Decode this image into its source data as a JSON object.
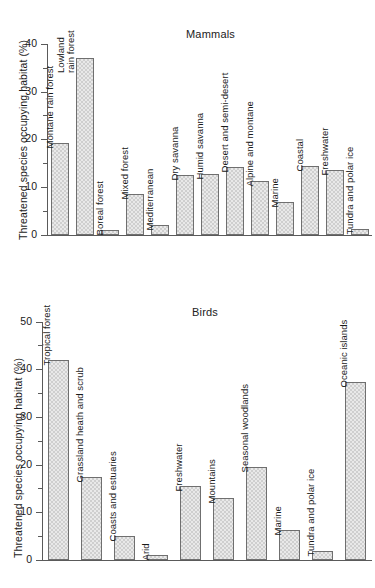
{
  "figure": {
    "ylabel": "Threatened species occupying habitat (%)",
    "footer_note": ""
  },
  "chart_data": [
    {
      "type": "bar",
      "title": "Mammals",
      "xlabel": "",
      "ylabel": "Threatened species occupying habitat (%)",
      "ylim": [
        0,
        41
      ],
      "yticks": [
        0,
        10,
        20,
        30,
        40
      ],
      "ytick_labels": [
        "0",
        "10",
        "20",
        "30",
        "40"
      ],
      "minor_tick_step": 5,
      "grid": false,
      "legend": "none",
      "categories": [
        "Montane rain forest",
        "Lowland\nrain forest",
        "Boreal forest",
        "Mixed forest",
        "Mediterranean",
        "Dry savanna",
        "Humid savanna",
        "Desert and semi-desert",
        "Alpine and montane",
        "Marine",
        "Coastal",
        "Freshwater",
        "Tundra and polar ice"
      ],
      "values": [
        19.2,
        37.0,
        1.0,
        8.5,
        2.0,
        12.6,
        12.7,
        14.3,
        11.2,
        7.0,
        14.5,
        13.6,
        1.2
      ]
    },
    {
      "type": "bar",
      "title": "Birds",
      "xlabel": "",
      "ylabel": "Threatened species occupying habitat (%)",
      "ylim": [
        0,
        52
      ],
      "yticks": [
        0,
        10,
        20,
        30,
        40,
        50
      ],
      "ytick_labels": [
        "0",
        "10",
        "20",
        "30",
        "40",
        "50"
      ],
      "minor_tick_step": 5,
      "grid": false,
      "legend": "none",
      "categories": [
        "Tropical forest",
        "Grassland heath and scrub",
        "Coasts and estuaries",
        "Arid",
        "Freshwater",
        "Mountains",
        "Seasonal woodlands",
        "Marine",
        "Tundra and polar ice",
        "Oceanic islands"
      ],
      "values": [
        42.0,
        17.5,
        5.0,
        1.0,
        15.5,
        13.0,
        19.6,
        6.2,
        1.8,
        37.4
      ]
    }
  ]
}
